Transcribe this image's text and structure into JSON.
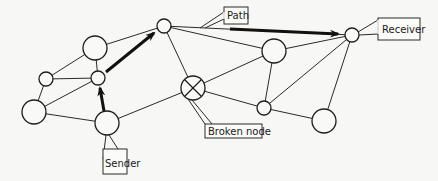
{
  "diagram": {
    "type": "network-routing",
    "labels": {
      "path": "Path",
      "receiver": "Receiver",
      "sender": "Sender",
      "broken_node": "Broken node"
    },
    "nodes": [
      {
        "id": "n_top_left_big",
        "x": 95,
        "y": 48,
        "r": 12
      },
      {
        "id": "n_left_small",
        "x": 46,
        "y": 79,
        "r": 7
      },
      {
        "id": "n_mid_small",
        "x": 98,
        "y": 78,
        "r": 7
      },
      {
        "id": "n_bottom_left_big",
        "x": 34,
        "y": 112,
        "r": 12
      },
      {
        "id": "sender",
        "x": 107,
        "y": 123,
        "r": 12
      },
      {
        "id": "n_top",
        "x": 164,
        "y": 26,
        "r": 7
      },
      {
        "id": "broken",
        "x": 193,
        "y": 88,
        "r": 12,
        "broken": true
      },
      {
        "id": "n_right_top_big",
        "x": 274,
        "y": 51,
        "r": 12
      },
      {
        "id": "receiver",
        "x": 352,
        "y": 35,
        "r": 7
      },
      {
        "id": "n_right_bottom_small",
        "x": 264,
        "y": 108,
        "r": 7
      },
      {
        "id": "n_right_bottom_big",
        "x": 324,
        "y": 121,
        "r": 12
      }
    ],
    "edges": [
      [
        "n_top_left_big",
        "n_left_small"
      ],
      [
        "n_top_left_big",
        "n_mid_small"
      ],
      [
        "n_top_left_big",
        "n_top"
      ],
      [
        "n_left_small",
        "n_mid_small"
      ],
      [
        "n_left_small",
        "n_bottom_left_big"
      ],
      [
        "n_mid_small",
        "n_bottom_left_big"
      ],
      [
        "n_bottom_left_big",
        "sender"
      ],
      [
        "sender",
        "broken"
      ],
      [
        "n_top",
        "broken"
      ],
      [
        "n_top",
        "n_right_top_big"
      ],
      [
        "n_top",
        "receiver"
      ],
      [
        "broken",
        "n_right_top_big"
      ],
      [
        "broken",
        "n_right_bottom_small"
      ],
      [
        "n_right_top_big",
        "n_right_bottom_small"
      ],
      [
        "n_right_top_big",
        "receiver"
      ],
      [
        "n_right_bottom_small",
        "receiver"
      ],
      [
        "n_right_bottom_small",
        "n_right_bottom_big"
      ],
      [
        "n_right_bottom_big",
        "receiver"
      ]
    ],
    "path": [
      "sender",
      "n_mid_small",
      "n_top",
      "receiver"
    ]
  }
}
